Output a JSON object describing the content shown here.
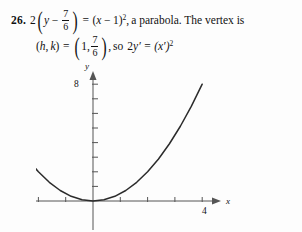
{
  "problem": {
    "number": "26.",
    "line1": {
      "coefficient": "2",
      "var_y": "y",
      "minus": "−",
      "fraction": {
        "numerator": "7",
        "denominator": "6"
      },
      "equals": "=",
      "rhs_open": "(",
      "rhs_var": "x",
      "rhs_minus": "−",
      "rhs_const": "1",
      "rhs_close": ")",
      "rhs_exponent": "2",
      "comma": ",",
      "description": "a parabola. The vertex is"
    },
    "line2": {
      "vertex_open": "(",
      "vertex_h": "h",
      "vertex_comma": ",",
      "vertex_k": "k",
      "vertex_close": ")",
      "equals": "=",
      "value_h": "1",
      "value_comma": ",",
      "value_k_fraction": {
        "numerator": "7",
        "denominator": "6"
      },
      "trailing_comma": ",",
      "so_text": "so",
      "transformed_lhs_coef": "2",
      "transformed_lhs_var": "y′",
      "transformed_equals": "=",
      "transformed_rhs": "(x′)",
      "transformed_rhs_exponent": "2"
    }
  },
  "chart_data": {
    "type": "line",
    "title": "",
    "xlabel": "x",
    "ylabel": "y",
    "equation": "2y' = (x')^2",
    "x_tick_label": "4",
    "y_tick_label": "8",
    "x_tick_label_value": 4,
    "y_tick_label_value": 8,
    "xlim": [
      -4.6,
      5.2
    ],
    "ylim": [
      -0.9,
      9.2
    ],
    "grid": false,
    "legend": false,
    "x_tick_values": [
      -4,
      -3,
      -2,
      -1,
      0,
      1,
      2,
      3,
      4
    ],
    "y_tick_values": [
      1,
      2,
      3,
      4,
      5,
      6,
      7,
      8
    ],
    "x": [
      -4.0,
      -3.6,
      -3.2,
      -2.8,
      -2.4,
      -2.0,
      -1.6,
      -1.2,
      -0.8,
      -0.4,
      0.0,
      0.4,
      0.8,
      1.2,
      1.6,
      2.0,
      2.4,
      2.8,
      3.2,
      3.6,
      4.0
    ],
    "y": [
      8.0,
      6.48,
      5.12,
      3.92,
      2.88,
      2.0,
      1.28,
      0.72,
      0.32,
      0.08,
      0.0,
      0.08,
      0.32,
      0.72,
      1.28,
      2.0,
      2.88,
      3.92,
      5.12,
      6.48,
      8.0
    ],
    "curve_color": "#2b2b2b",
    "axis_color": "#555555"
  }
}
